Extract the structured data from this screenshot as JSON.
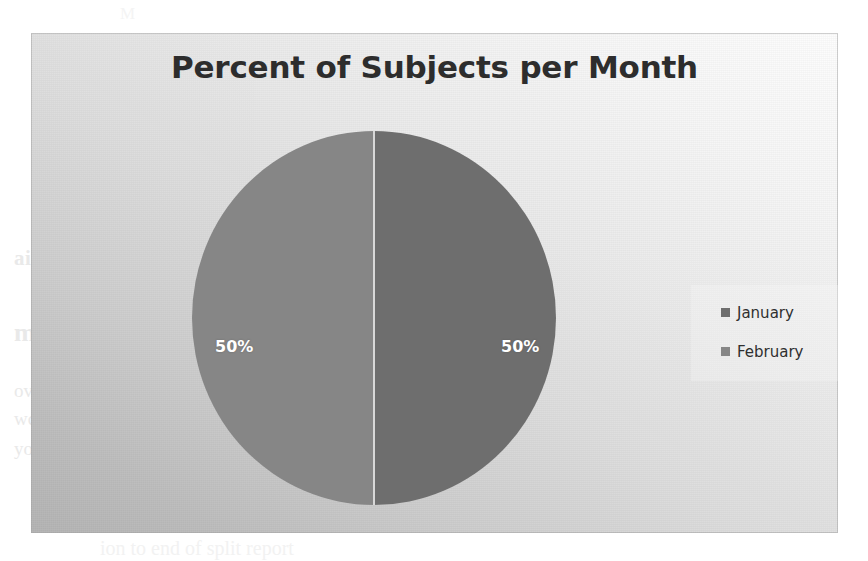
{
  "chart": {
    "title": "Percent of Subjects per Month",
    "frame_background": "#dcdcdc",
    "title_color": "#2d2d2d"
  },
  "legend": {
    "position": "right",
    "items": [
      {
        "label": "January",
        "color": "#6e6e6e"
      },
      {
        "label": "February",
        "color": "#868686"
      }
    ]
  },
  "labels": {
    "january": "50%",
    "february": "50%"
  },
  "page_ghost": {
    "line_a": "ain the parameter",
    "line_b": "mary",
    "line_c": "over to create a table with one row",
    "line_d": "wcase a way to view a column",
    "line_e": "you to better learn to end PC work",
    "line_f": "ion to end of split report",
    "line_g": "M"
  },
  "chart_data": {
    "type": "pie",
    "title": "Percent of Subjects per Month",
    "xlabel": "",
    "ylabel": "",
    "categories": [
      "January",
      "February"
    ],
    "values": [
      50,
      50
    ],
    "unit": "%",
    "data_labels": [
      "50%",
      "50%"
    ],
    "colors": [
      "#6e6e6e",
      "#868686"
    ],
    "legend_position": "right",
    "grid": false,
    "start_angle": 0,
    "direction": "clockwise"
  }
}
